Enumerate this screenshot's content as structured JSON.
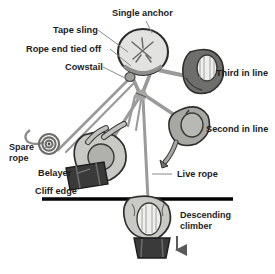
{
  "figure": {
    "type": "technical-illustration",
    "background_color": "#ffffff",
    "text_color": "#1c1c1c",
    "leader_line_color": "#8a8a8a",
    "palette": {
      "rock_light": "#e2e2e0",
      "rock_outline": "#2b2b2b",
      "rope_gray": "#9a9a9a",
      "body_light": "#c9c9c6",
      "body_mid": "#a7a7a4",
      "body_dark": "#777774",
      "helmet_dark": "#6e6e6c",
      "pack_dark": "#3a3a3a",
      "cliff_line": "#000000"
    }
  },
  "labels": [
    {
      "id": "single-anchor",
      "text": "Single anchor",
      "x": 112,
      "y": 16,
      "anchor": "start"
    },
    {
      "id": "tape-sling",
      "text": "Tape sling",
      "x": 53,
      "y": 33,
      "anchor": "start"
    },
    {
      "id": "rope-end-tied-off",
      "text": "Rope end tied off",
      "x": 26,
      "y": 52,
      "anchor": "start"
    },
    {
      "id": "cowstail",
      "text": "Cowstail",
      "x": 65,
      "y": 70,
      "anchor": "start"
    },
    {
      "id": "third-in-line",
      "text": "Third in line",
      "x": 216,
      "y": 76,
      "anchor": "start"
    },
    {
      "id": "second-in-line",
      "text": "Second in line",
      "x": 208,
      "y": 132,
      "anchor": "start"
    },
    {
      "id": "spare-rope-1",
      "text": "Spare",
      "x": 9,
      "y": 150,
      "anchor": "start"
    },
    {
      "id": "spare-rope-2",
      "text": "rope",
      "x": 9,
      "y": 160,
      "anchor": "start"
    },
    {
      "id": "belayer",
      "text": "Belayer",
      "x": 38,
      "y": 176,
      "anchor": "start"
    },
    {
      "id": "live-rope",
      "text": "Live rope",
      "x": 177,
      "y": 177,
      "anchor": "start"
    },
    {
      "id": "cliff-edge",
      "text": "Cliff edge",
      "x": 35,
      "y": 194,
      "anchor": "start"
    },
    {
      "id": "descending-1",
      "text": "Descending",
      "x": 180,
      "y": 218,
      "anchor": "start"
    },
    {
      "id": "descending-2",
      "text": "climber",
      "x": 180,
      "y": 229,
      "anchor": "start"
    }
  ],
  "callout_lines": [
    {
      "id": "lead-single-anchor",
      "x1": 146,
      "y1": 21,
      "x2": 152,
      "y2": 33
    },
    {
      "id": "lead-tape-sling",
      "x1": 98,
      "y1": 30,
      "x2": 128,
      "y2": 52
    },
    {
      "id": "lead-rope-end",
      "x1": 110,
      "y1": 49,
      "x2": 131,
      "y2": 64
    },
    {
      "id": "lead-cowstail",
      "x1": 103,
      "y1": 67,
      "x2": 127,
      "y2": 79
    },
    {
      "id": "lead-belayer",
      "x1": 78,
      "y1": 173,
      "x2": 92,
      "y2": 168
    },
    {
      "id": "lead-live-rope",
      "x1": 152,
      "y1": 174,
      "x2": 170,
      "y2": 174
    },
    {
      "id": "lead-spare-rope",
      "x1": 44,
      "y1": 150,
      "x2": 54,
      "y2": 147
    }
  ],
  "elements": {
    "anchor": {
      "name": "boulder anchor",
      "note": "round rock with X-shaped crack, sling tied around it"
    },
    "cliff_edge_line": {
      "name": "cliff edge",
      "x1": 42,
      "y1": 199,
      "x2": 233,
      "y2": 199
    },
    "descent_arrow": {
      "name": "descent direction arrow",
      "direction": "down"
    },
    "climbers": [
      {
        "id": "third-in-line",
        "position": "top right"
      },
      {
        "id": "second-in-line",
        "position": "mid right"
      },
      {
        "id": "belayer",
        "position": "center left, above cliff edge"
      },
      {
        "id": "descending-climber",
        "position": "below cliff edge"
      }
    ]
  }
}
